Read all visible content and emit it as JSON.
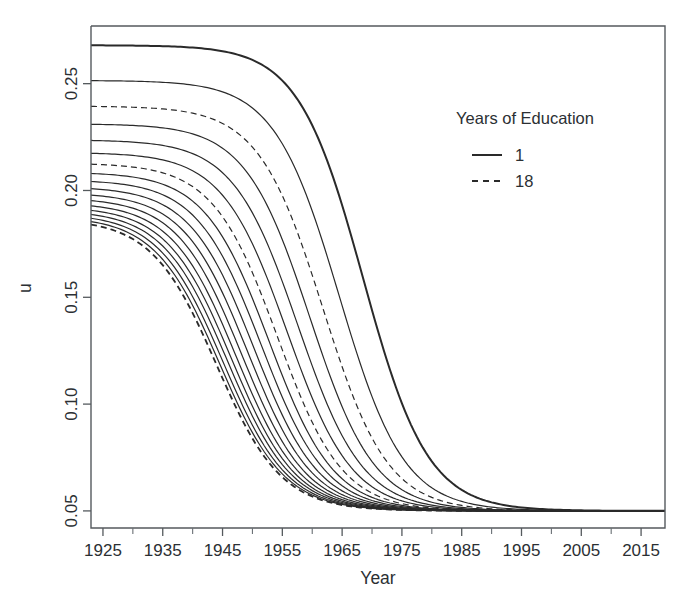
{
  "figure": {
    "background_color": "#ffffff",
    "line_color": "#2a2a2a",
    "axis_color": "#555a5e"
  },
  "axes": {
    "x": {
      "label": "Year",
      "ticks": [
        "1925",
        "1935",
        "1945",
        "1955",
        "1965",
        "1975",
        "1985",
        "1995",
        "2005",
        "2015"
      ],
      "minor_ticks": [
        "1930",
        "1940",
        "1950",
        "1960",
        "1970",
        "1980",
        "1990",
        "2000",
        "2010"
      ],
      "range": [
        1923,
        2019
      ]
    },
    "y": {
      "label": "u",
      "ticks": [
        "0.05",
        "0.10",
        "0.15",
        "0.20",
        "0.25"
      ],
      "range": [
        0.042,
        0.277
      ]
    }
  },
  "legend": {
    "title": "Years of Education",
    "entries": [
      {
        "label": "1",
        "style": "solid"
      },
      {
        "label": "18",
        "style": "dashed"
      }
    ]
  },
  "chart_data": {
    "type": "line",
    "title": "",
    "xlabel": "Year",
    "ylabel": "u",
    "xlim": [
      1923,
      2019
    ],
    "ylim": [
      0.042,
      0.277
    ],
    "xticks": [
      1925,
      1935,
      1945,
      1955,
      1965,
      1975,
      1985,
      1995,
      2005,
      2015
    ],
    "yticks": [
      0.05,
      0.1,
      0.15,
      0.2,
      0.25
    ],
    "grid": false,
    "legend_position": "upper-right-inside",
    "legend_title": "Years of Education",
    "x": [
      1925,
      1930,
      1935,
      1940,
      1945,
      1950,
      1955,
      1960,
      1965,
      1970,
      1975,
      1980,
      1985,
      1990,
      1995,
      2000,
      2005,
      2010,
      2015
    ],
    "series": [
      {
        "name": "1",
        "education_years": 1,
        "style": "solid",
        "linewidth": 2.0,
        "plateau": 0.268,
        "floor": 0.05,
        "midpoint_year": 1968.5,
        "rate": 0.185,
        "values": [
          0.268,
          0.268,
          0.268,
          0.2678,
          0.2673,
          0.2661,
          0.2631,
          0.2556,
          0.2375,
          0.1984,
          0.1363,
          0.081,
          0.0578,
          0.0512,
          0.0502,
          0.05,
          0.05,
          0.05,
          0.05
        ]
      },
      {
        "name": "2",
        "education_years": 2,
        "style": "solid",
        "linewidth": 1.2,
        "plateau": 0.2515,
        "floor": 0.05,
        "midpoint_year": 1964.5,
        "rate": 0.185,
        "values": [
          0.2515,
          0.2515,
          0.2514,
          0.2511,
          0.2504,
          0.2486,
          0.2443,
          0.234,
          0.2104,
          0.1657,
          0.1103,
          0.0721,
          0.0557,
          0.0508,
          0.0501,
          0.05,
          0.05,
          0.05,
          0.05
        ]
      },
      {
        "name": "3",
        "education_years": 3,
        "style": "dashed",
        "linewidth": 1.2,
        "plateau": 0.2395,
        "floor": 0.05,
        "midpoint_year": 1961.8,
        "rate": 0.185,
        "values": [
          0.2395,
          0.2394,
          0.2392,
          0.2388,
          0.2378,
          0.2353,
          0.2295,
          0.2165,
          0.1899,
          0.1457,
          0.097,
          0.0669,
          0.0542,
          0.0506,
          0.0501,
          0.05,
          0.05,
          0.05,
          0.05
        ]
      },
      {
        "name": "4",
        "education_years": 4,
        "style": "solid",
        "linewidth": 1.2,
        "plateau": 0.2312,
        "floor": 0.05,
        "midpoint_year": 1959.6,
        "rate": 0.185,
        "values": [
          0.2312,
          0.2311,
          0.2308,
          0.2302,
          0.2288,
          0.2256,
          0.2183,
          0.2031,
          0.1751,
          0.1331,
          0.0897,
          0.0639,
          0.0534,
          0.0505,
          0.05,
          0.05,
          0.05,
          0.05,
          0.05
        ]
      },
      {
        "name": "5",
        "education_years": 5,
        "style": "solid",
        "linewidth": 1.2,
        "plateau": 0.2237,
        "floor": 0.05,
        "midpoint_year": 1957.6,
        "rate": 0.185,
        "values": [
          0.2237,
          0.2235,
          0.2231,
          0.2223,
          0.2205,
          0.2164,
          0.2077,
          0.1909,
          0.1625,
          0.1229,
          0.0842,
          0.0616,
          0.0527,
          0.0504,
          0.05,
          0.05,
          0.05,
          0.05,
          0.05
        ]
      },
      {
        "name": "6",
        "education_years": 6,
        "style": "solid",
        "linewidth": 1.2,
        "plateau": 0.2178,
        "floor": 0.05,
        "midpoint_year": 1955.8,
        "rate": 0.185,
        "values": [
          0.2177,
          0.2175,
          0.2169,
          0.2158,
          0.2135,
          0.2086,
          0.1986,
          0.1805,
          0.1522,
          0.115,
          0.0802,
          0.06,
          0.0522,
          0.0503,
          0.05,
          0.05,
          0.05,
          0.05,
          0.05
        ]
      },
      {
        "name": "7",
        "education_years": 7,
        "style": "dashed",
        "linewidth": 1.2,
        "plateau": 0.2128,
        "floor": 0.05,
        "midpoint_year": 1954.2,
        "rate": 0.185,
        "values": [
          0.2127,
          0.2124,
          0.2117,
          0.2103,
          0.2075,
          0.2018,
          0.1908,
          0.172,
          0.1441,
          0.109,
          0.0772,
          0.0588,
          0.0519,
          0.0503,
          0.05,
          0.05,
          0.05,
          0.05,
          0.05
        ]
      },
      {
        "name": "8",
        "education_years": 8,
        "style": "solid",
        "linewidth": 1.2,
        "plateau": 0.2086,
        "floor": 0.05,
        "midpoint_year": 1952.8,
        "rate": 0.185,
        "values": [
          0.2084,
          0.2081,
          0.2072,
          0.2056,
          0.2023,
          0.1959,
          0.184,
          0.1648,
          0.1375,
          0.1044,
          0.075,
          0.0579,
          0.0516,
          0.0502,
          0.05,
          0.05,
          0.05,
          0.05,
          0.05
        ]
      },
      {
        "name": "9",
        "education_years": 9,
        "style": "solid",
        "linewidth": 1.2,
        "plateau": 0.205,
        "floor": 0.05,
        "midpoint_year": 1951.5,
        "rate": 0.185,
        "values": [
          0.2047,
          0.2043,
          0.2033,
          0.2014,
          0.1977,
          0.1907,
          0.1781,
          0.1587,
          0.1321,
          0.1007,
          0.0733,
          0.0572,
          0.0514,
          0.0502,
          0.05,
          0.05,
          0.05,
          0.05,
          0.05
        ]
      },
      {
        "name": "10",
        "education_years": 10,
        "style": "solid",
        "linewidth": 1.2,
        "plateau": 0.2018,
        "floor": 0.05,
        "midpoint_year": 1950.3,
        "rate": 0.185,
        "values": [
          0.2014,
          0.2009,
          0.1998,
          0.1976,
          0.1936,
          0.186,
          0.1729,
          0.1535,
          0.1276,
          0.0978,
          0.0719,
          0.0567,
          0.0513,
          0.0502,
          0.05,
          0.05,
          0.05,
          0.05,
          0.05
        ]
      },
      {
        "name": "11",
        "education_years": 11,
        "style": "solid",
        "linewidth": 1.2,
        "plateau": 0.199,
        "floor": 0.05,
        "midpoint_year": 1949.2,
        "rate": 0.185,
        "values": [
          0.1985,
          0.1979,
          0.1966,
          0.1942,
          0.1898,
          0.1818,
          0.1683,
          0.149,
          0.1239,
          0.0954,
          0.0708,
          0.0563,
          0.0511,
          0.0501,
          0.05,
          0.05,
          0.05,
          0.05,
          0.05
        ]
      },
      {
        "name": "12",
        "education_years": 12,
        "style": "solid",
        "linewidth": 1.2,
        "plateau": 0.1966,
        "floor": 0.05,
        "midpoint_year": 1948.2,
        "rate": 0.185,
        "values": [
          0.1959,
          0.1952,
          0.1938,
          0.1912,
          0.1865,
          0.1781,
          0.1643,
          0.1451,
          0.1207,
          0.0934,
          0.0699,
          0.0559,
          0.051,
          0.0501,
          0.05,
          0.05,
          0.05,
          0.05,
          0.05
        ]
      },
      {
        "name": "13",
        "education_years": 13,
        "style": "solid",
        "linewidth": 1.2,
        "plateau": 0.1944,
        "floor": 0.05,
        "midpoint_year": 1947.3,
        "rate": 0.185,
        "values": [
          0.1936,
          0.1928,
          0.1912,
          0.1884,
          0.1835,
          0.1748,
          0.1608,
          0.1418,
          0.118,
          0.0918,
          0.0692,
          0.0556,
          0.0509,
          0.0501,
          0.05,
          0.05,
          0.05,
          0.05,
          0.05
        ]
      },
      {
        "name": "14",
        "education_years": 14,
        "style": "solid",
        "linewidth": 1.2,
        "plateau": 0.1925,
        "floor": 0.05,
        "midpoint_year": 1946.5,
        "rate": 0.185,
        "values": [
          0.1915,
          0.1906,
          0.1889,
          0.1859,
          0.1808,
          0.1719,
          0.1577,
          0.1388,
          0.1156,
          0.0904,
          0.0686,
          0.0554,
          0.0509,
          0.0501,
          0.05,
          0.05,
          0.05,
          0.05,
          0.05
        ]
      },
      {
        "name": "15",
        "education_years": 15,
        "style": "solid",
        "linewidth": 1.2,
        "plateau": 0.1908,
        "floor": 0.05,
        "midpoint_year": 1945.8,
        "rate": 0.185,
        "values": [
          0.1896,
          0.1886,
          0.1868,
          0.1836,
          0.1784,
          0.1693,
          0.155,
          0.1362,
          0.1135,
          0.0892,
          0.0681,
          0.0552,
          0.0508,
          0.0501,
          0.05,
          0.05,
          0.05,
          0.05,
          0.05
        ]
      },
      {
        "name": "16",
        "education_years": 16,
        "style": "solid",
        "linewidth": 1.2,
        "plateau": 0.1893,
        "floor": 0.05,
        "midpoint_year": 1945.1,
        "rate": 0.185,
        "values": [
          0.1879,
          0.1868,
          0.1849,
          0.1816,
          0.1762,
          0.167,
          0.1526,
          0.1339,
          0.1117,
          0.0881,
          0.0676,
          0.0551,
          0.0508,
          0.0501,
          0.05,
          0.05,
          0.05,
          0.05,
          0.05
        ]
      },
      {
        "name": "17",
        "education_years": 17,
        "style": "solid",
        "linewidth": 1.2,
        "plateau": 0.188,
        "floor": 0.05,
        "midpoint_year": 1944.5,
        "rate": 0.185,
        "values": [
          0.1864,
          0.1853,
          0.1832,
          0.1798,
          0.1743,
          0.1649,
          0.1505,
          0.1319,
          0.1101,
          0.0872,
          0.0672,
          0.0549,
          0.0507,
          0.0501,
          0.05,
          0.05,
          0.05,
          0.05,
          0.05
        ]
      },
      {
        "name": "18",
        "education_years": 18,
        "style": "dashed",
        "linewidth": 1.8,
        "plateau": 0.1868,
        "floor": 0.05,
        "midpoint_year": 1944.0,
        "rate": 0.185,
        "values": [
          0.1851,
          0.1839,
          0.1817,
          0.1782,
          0.1726,
          0.1631,
          0.1487,
          0.1302,
          0.1088,
          0.0864,
          0.0669,
          0.0548,
          0.0507,
          0.0501,
          0.05,
          0.05,
          0.05,
          0.05,
          0.05
        ]
      }
    ]
  }
}
